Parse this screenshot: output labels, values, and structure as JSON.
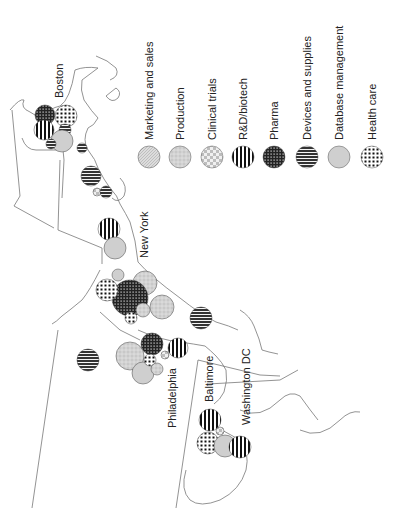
{
  "legend": {
    "items": [
      {
        "label": "Marketing and sales",
        "pattern": "pat-marketing"
      },
      {
        "label": "Production",
        "pattern": "pat-production"
      },
      {
        "label": "Clinical trials",
        "pattern": "pat-clinical"
      },
      {
        "label": "R&D/biotech",
        "pattern": "pat-rnd"
      },
      {
        "label": "Pharma",
        "pattern": "pat-pharma"
      },
      {
        "label": "Devices and supplies",
        "pattern": "pat-devices"
      },
      {
        "label": "Database management",
        "pattern": "pat-database"
      },
      {
        "label": "Health care",
        "pattern": "pat-health"
      }
    ]
  },
  "cities": {
    "boston": "Boston",
    "new_york": "New York",
    "philadelphia": "Philadelphia",
    "baltimore": "Baltimore",
    "washington": "Washington DC"
  },
  "colors": {
    "outline": "#777777",
    "fill_light": "#d0d0d0",
    "fill_dark": "#222222"
  }
}
